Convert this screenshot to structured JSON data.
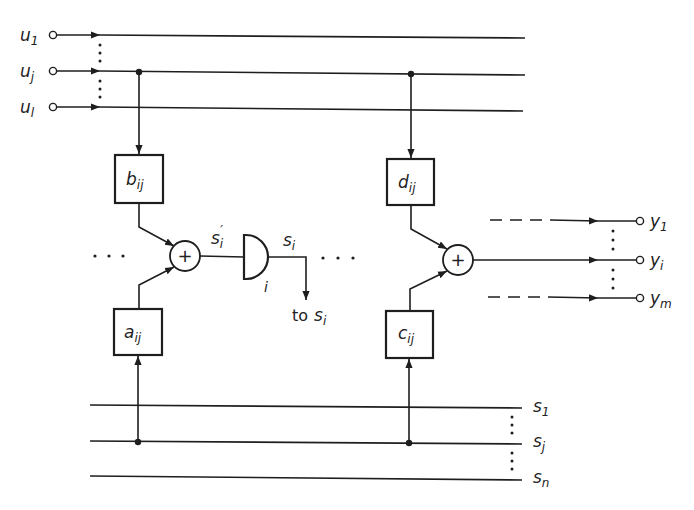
{
  "diagram": {
    "type": "block-diagram",
    "inputs": {
      "labels": [
        {
          "base": "u",
          "sub": "1"
        },
        {
          "base": "u",
          "sub": "j"
        },
        {
          "base": "u",
          "sub": "l"
        }
      ]
    },
    "states": {
      "labels": [
        {
          "base": "s",
          "sub": "1"
        },
        {
          "base": "s",
          "sub": "j"
        },
        {
          "base": "s",
          "sub": "n"
        }
      ]
    },
    "outputs": {
      "labels": [
        {
          "base": "y",
          "sub": "1"
        },
        {
          "base": "y",
          "sub": "i"
        },
        {
          "base": "y",
          "sub": "m"
        }
      ]
    },
    "blocks": {
      "b": {
        "base": "b",
        "sub": "ij"
      },
      "a": {
        "base": "a",
        "sub": "ij"
      },
      "d": {
        "base": "d",
        "sub": "ij"
      },
      "c": {
        "base": "c",
        "sub": "ij"
      }
    },
    "adder_symbol": "+",
    "delay": {
      "input_label": {
        "base": "s",
        "sub": "i",
        "prime": "′"
      },
      "output_label": {
        "base": "s",
        "sub": "i"
      },
      "index_label": "i",
      "feedback_label": {
        "prefix": "to",
        "base": "s",
        "sub": "i"
      }
    },
    "ellipsis": "· · ·"
  }
}
